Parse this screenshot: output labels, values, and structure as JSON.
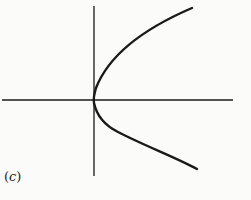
{
  "figure": {
    "label_open": "(",
    "label_letter": "c",
    "label_close": ")",
    "curve": "sideways parabola opening right, vertex at origin",
    "colors": {
      "background": "#fbfbf9",
      "stroke": "#1a1a1a"
    }
  }
}
